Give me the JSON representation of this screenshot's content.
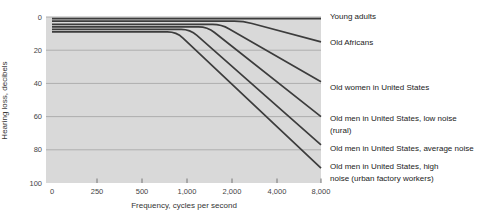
{
  "chart_data": {
    "type": "line",
    "title": "",
    "xlabel": "Frequency, cycles per second",
    "ylabel": "Hearing loss, decibels",
    "x_axis": {
      "tick_labels": [
        "0",
        "250",
        "500",
        "1,000",
        "2,000",
        "4,000",
        "8,000"
      ],
      "tick_freqs": [
        0,
        250,
        500,
        1000,
        2000,
        4000,
        8000
      ],
      "scale": "equal spacing per tick (octaves above 250)"
    },
    "y_axis": {
      "ticks": [
        0,
        20,
        40,
        60,
        80,
        100
      ],
      "range": [
        0,
        100
      ],
      "inverted": true,
      "grid": true
    },
    "legend_position": "right-of-plot, aligned with curve endpoints",
    "series": [
      {
        "name": "Young adults",
        "label_lines": [
          "Young adults"
        ],
        "points": [
          [
            0,
            1
          ],
          [
            8000,
            1
          ]
        ]
      },
      {
        "name": "Old Africans",
        "label_lines": [
          "Old Africans"
        ],
        "points": [
          [
            0,
            2.5
          ],
          [
            2380,
            2.5
          ],
          [
            8000,
            15
          ]
        ]
      },
      {
        "name": "Old women in United States",
        "label_lines": [
          "Old women in United States"
        ],
        "points": [
          [
            0,
            4.5
          ],
          [
            1700,
            4.5
          ],
          [
            8000,
            39
          ]
        ]
      },
      {
        "name": "Old men in United States, low noise (rural)",
        "label_lines": [
          "Old men in United States, low noise",
          "(rural)"
        ],
        "points": [
          [
            0,
            6
          ],
          [
            1370,
            6
          ],
          [
            8000,
            60
          ]
        ]
      },
      {
        "name": "Old men in United States, average noise",
        "label_lines": [
          "Old men in United States, average noise"
        ],
        "points": [
          [
            0,
            7.5
          ],
          [
            1050,
            7.5
          ],
          [
            8000,
            77
          ]
        ]
      },
      {
        "name": "Old men in United States, high noise (urban factory workers)",
        "label_lines": [
          "Old men in United States, high",
          "noise (urban factory workers)"
        ],
        "points": [
          [
            0,
            9
          ],
          [
            850,
            9
          ],
          [
            8000,
            91
          ]
        ]
      }
    ]
  },
  "colors": {
    "plot_background": "#d9d9d9",
    "gridline": "#aeaeae",
    "curve": "#3c3c3c",
    "tick_mark": "#777777",
    "text": "#333333"
  }
}
